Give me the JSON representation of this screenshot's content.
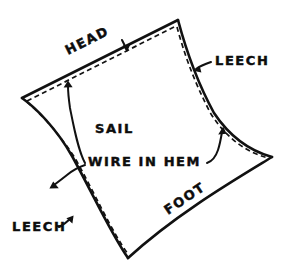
{
  "diagram": {
    "background_color": "#ffffff",
    "ink_color": "#111111",
    "labels": {
      "head": "HEAD",
      "leech_upper_right": "LEECH",
      "leech_lower_left": "LEECH",
      "sail": "SAIL",
      "wire_in_hem": "WIRE IN HEM",
      "foot": "FOOT"
    },
    "edges": [
      {
        "name": "head",
        "style": "solid-with-dashed-wire",
        "label": "HEAD"
      },
      {
        "name": "right-leech",
        "style": "solid-with-dashed-wire",
        "label": "LEECH"
      },
      {
        "name": "left-leech",
        "style": "solid-with-dashed-wire",
        "label": "LEECH"
      },
      {
        "name": "foot",
        "style": "solid",
        "label": "FOOT"
      }
    ],
    "corners": [
      {
        "name": "peak",
        "x": 178,
        "y": 20
      },
      {
        "name": "throat",
        "x": 22,
        "y": 98
      },
      {
        "name": "tack",
        "x": 128,
        "y": 258
      },
      {
        "name": "clew",
        "x": 272,
        "y": 157
      }
    ],
    "leaders": [
      {
        "name": "head-arrow",
        "from": "wire-in-hem",
        "to": "head-edge"
      },
      {
        "name": "left-leech-arrow",
        "from": "wire-in-hem",
        "to": "left-leech-edge"
      },
      {
        "name": "right-leech-arrow",
        "from": "wire-in-hem",
        "to": "right-leech-edge"
      },
      {
        "name": "upper-leech-arrow",
        "from": "leech-label",
        "to": "right-leech-edge"
      },
      {
        "name": "lower-leech-arrow",
        "from": "leech-label",
        "to": "left-leech-edge"
      },
      {
        "name": "head-label-arrow",
        "from": "head-label",
        "to": "head-edge"
      }
    ]
  }
}
